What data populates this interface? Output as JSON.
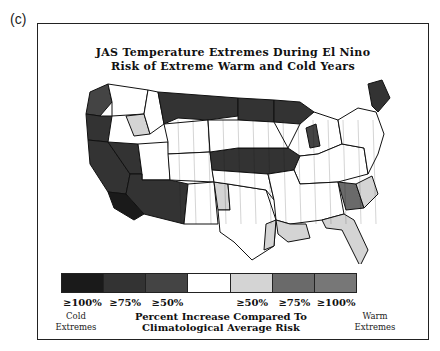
{
  "panel_label": "(c)",
  "title": {
    "line1": "JAS Temperature Extremes During El Nino",
    "line2": "Risk of Extreme Warm and Cold Years"
  },
  "legend": {
    "categories": [
      {
        "label": "≥100%",
        "side": "cold",
        "color": "#1a1a1a"
      },
      {
        "label": "≥75%",
        "side": "cold",
        "color": "#333333"
      },
      {
        "label": "≥50%",
        "side": "cold",
        "color": "#444444"
      },
      {
        "label": "",
        "side": "neutral",
        "color": "#ffffff"
      },
      {
        "label": "≥50%",
        "side": "warm",
        "color": "#d4d4d4"
      },
      {
        "label": "≥75%",
        "side": "warm",
        "color": "#6a6a6a"
      },
      {
        "label": "≥100%",
        "side": "warm",
        "color": "#777777"
      }
    ],
    "cold_caption": [
      "Cold",
      "Extremes"
    ],
    "warm_caption": [
      "Warm",
      "Extremes"
    ],
    "center_caption": [
      "Percent Increase Compared To",
      "Climatological Average Risk"
    ]
  },
  "map": {
    "regions": [
      {
        "name": "pacific-northwest-coast",
        "category": 2
      },
      {
        "name": "washington-interior",
        "category": 3
      },
      {
        "name": "idaho-panhandle-warm",
        "category": 4
      },
      {
        "name": "northern-rockies",
        "category": 3
      },
      {
        "name": "montana-north",
        "category": 1
      },
      {
        "name": "north-dakota",
        "category": 1
      },
      {
        "name": "minnesota-north",
        "category": 1
      },
      {
        "name": "oregon-south",
        "category": 1
      },
      {
        "name": "california-north",
        "category": 1
      },
      {
        "name": "california-south",
        "category": 0
      },
      {
        "name": "nevada",
        "category": 1
      },
      {
        "name": "utah",
        "category": 3
      },
      {
        "name": "arizona",
        "category": 1
      },
      {
        "name": "wyoming",
        "category": 3
      },
      {
        "name": "colorado",
        "category": 3
      },
      {
        "name": "new-mexico",
        "category": 3
      },
      {
        "name": "new-mexico-east-warm",
        "category": 4
      },
      {
        "name": "texas",
        "category": 3
      },
      {
        "name": "texas-coast-warm",
        "category": 4
      },
      {
        "name": "nebraska-iowa-band",
        "category": 1
      },
      {
        "name": "south-dakota",
        "category": 3
      },
      {
        "name": "kansas-oklahoma",
        "category": 3
      },
      {
        "name": "great-lakes",
        "category": 3
      },
      {
        "name": "michigan-west",
        "category": 2
      },
      {
        "name": "ohio-valley",
        "category": 3
      },
      {
        "name": "southeast",
        "category": 3
      },
      {
        "name": "georgia-carolina-warm",
        "category": 5
      },
      {
        "name": "southeast-coast-warm",
        "category": 4
      },
      {
        "name": "florida",
        "category": 4
      },
      {
        "name": "louisiana-mississippi",
        "category": 4
      },
      {
        "name": "northeast",
        "category": 3
      },
      {
        "name": "maine",
        "category": 1
      }
    ]
  }
}
